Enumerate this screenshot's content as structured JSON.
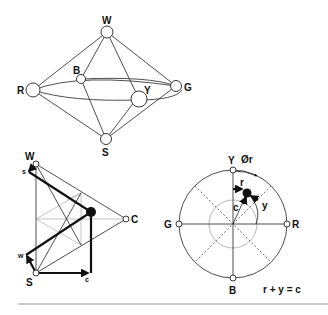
{
  "figure": {
    "top_diagram": {
      "name": "color-octahedron",
      "labels": {
        "W": "W",
        "R": "R",
        "B": "B",
        "Y": "Y",
        "G": "G",
        "S": "S"
      }
    },
    "left_diagram": {
      "name": "color-triangle-wsc",
      "labels": {
        "W": "W",
        "S": "S",
        "C": "C",
        "s": "s",
        "w": "w",
        "c": "c"
      }
    },
    "right_diagram": {
      "name": "hue-circle",
      "labels": {
        "Y": "Y",
        "phi_r": "Ør",
        "r": "r",
        "y": "y",
        "c": "c",
        "G": "G",
        "R": "R",
        "B": "B"
      },
      "equation": "r + y = c"
    }
  }
}
